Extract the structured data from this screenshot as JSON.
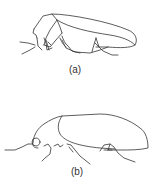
{
  "figure": {
    "panels": [
      {
        "id": "a",
        "label": "(a)",
        "subject": "beetle-side-view"
      },
      {
        "id": "b",
        "label": "(b)",
        "subject": "beetle-side-view"
      }
    ],
    "colors": {
      "line": "#333333",
      "background": "#ffffff"
    }
  }
}
